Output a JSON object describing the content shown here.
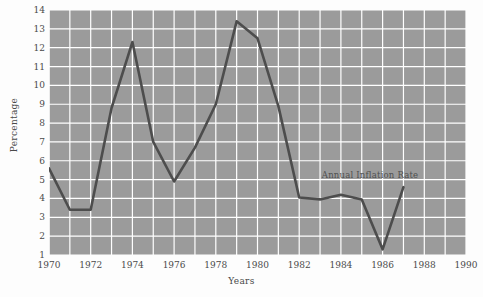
{
  "chart_data": {
    "type": "line",
    "title": "",
    "xlabel": "Years",
    "ylabel": "Percentage",
    "xlim": [
      1970,
      1990
    ],
    "ylim": [
      1,
      14
    ],
    "grid": true,
    "legend_position": "inline-annotation",
    "xticks": [
      "1970",
      "1972",
      "1974",
      "1976",
      "1978",
      "1980",
      "1982",
      "1984",
      "1986",
      "1988",
      "1990"
    ],
    "xtick_values": [
      1970,
      1972,
      1974,
      1976,
      1978,
      1980,
      1982,
      1984,
      1986,
      1988,
      1990
    ],
    "yticks": [
      "1",
      "2",
      "3",
      "4",
      "5",
      "6",
      "7",
      "8",
      "9",
      "10",
      "11",
      "12",
      "13",
      "14"
    ],
    "ytick_values": [
      1,
      2,
      3,
      4,
      5,
      6,
      7,
      8,
      9,
      10,
      11,
      12,
      13,
      14
    ],
    "x_minor_step": 1,
    "y_minor_step": 1,
    "annotations": [
      {
        "text": "Annual Inflation Rate",
        "x": 1985.4,
        "y": 5.25
      }
    ],
    "series": [
      {
        "name": "Annual Inflation Rate",
        "color": "#4d4d4d",
        "x": [
          1970,
          1971,
          1972,
          1973,
          1974,
          1975,
          1976,
          1977,
          1978,
          1979,
          1980,
          1981,
          1982,
          1983,
          1984,
          1985,
          1986,
          1987
        ],
        "values": [
          5.6,
          3.4,
          3.4,
          8.8,
          12.3,
          7.0,
          4.9,
          6.7,
          9.0,
          13.4,
          12.5,
          8.9,
          4.05,
          3.95,
          4.2,
          3.95,
          1.3,
          4.6
        ]
      }
    ]
  },
  "axes": {
    "y_title": "Percentage",
    "x_title": "Years"
  },
  "colors": {
    "plot_background": "#9b9b9b",
    "gridline": "#ffffff",
    "series_line": "#4d4d4d",
    "text": "#4a4a4a",
    "page_background": "#fdfdfd"
  }
}
